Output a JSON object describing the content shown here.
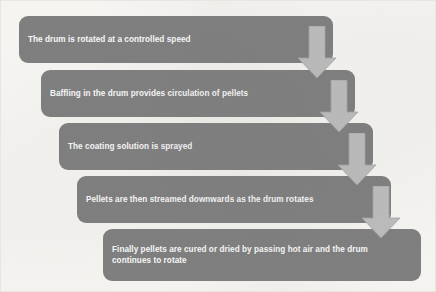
{
  "diagram": {
    "type": "staircase-flowchart",
    "colors": {
      "background": "#fbfaf7",
      "box_fill": "#7f7f7f",
      "box_text": "#ffffff",
      "arrow_fill": "#bfbfbf",
      "arrow_edge": "#a6a6a6",
      "frame_border": "#e8e6e2"
    },
    "steps": [
      {
        "index": 1,
        "label": "The drum is rotated at a controlled speed",
        "x": 18,
        "y": 15,
        "width": 314,
        "height": 47
      },
      {
        "index": 2,
        "label": "Baffling in the drum provides circulation of pellets",
        "x": 40,
        "y": 69,
        "width": 314,
        "height": 47
      },
      {
        "index": 3,
        "label": "The coating solution is sprayed",
        "x": 58,
        "y": 122,
        "width": 314,
        "height": 47
      },
      {
        "index": 4,
        "label": "Pellets are then streamed downwards as the drum rotates",
        "x": 76,
        "y": 175,
        "width": 314,
        "height": 47
      },
      {
        "index": 5,
        "label": "Finally pellets are cured or dried by passing hot air and the drum\ncontinues to rotate",
        "x": 102,
        "y": 228,
        "width": 318,
        "height": 52
      }
    ],
    "connectors": [
      {
        "index": 1,
        "from_step": 1,
        "to_step": 2,
        "direction": "down",
        "x": 296,
        "y": 25,
        "width": 40,
        "height": 53
      },
      {
        "index": 2,
        "from_step": 2,
        "to_step": 3,
        "direction": "down",
        "x": 318,
        "y": 79,
        "width": 40,
        "height": 53
      },
      {
        "index": 3,
        "from_step": 3,
        "to_step": 4,
        "direction": "down",
        "x": 336,
        "y": 132,
        "width": 40,
        "height": 53
      },
      {
        "index": 4,
        "from_step": 4,
        "to_step": 5,
        "direction": "down",
        "x": 360,
        "y": 185,
        "width": 40,
        "height": 53
      }
    ]
  }
}
